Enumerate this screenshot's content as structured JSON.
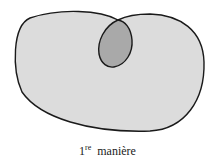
{
  "diagram": {
    "outer_shape": {
      "fill": "#dcdcdc",
      "stroke": "#1a1a1a"
    },
    "inner_shape": {
      "fill": "#a9a9a9",
      "stroke": "#1a1a1a"
    }
  },
  "caption": {
    "number": "1",
    "superscript": "re",
    "text": "manière"
  }
}
